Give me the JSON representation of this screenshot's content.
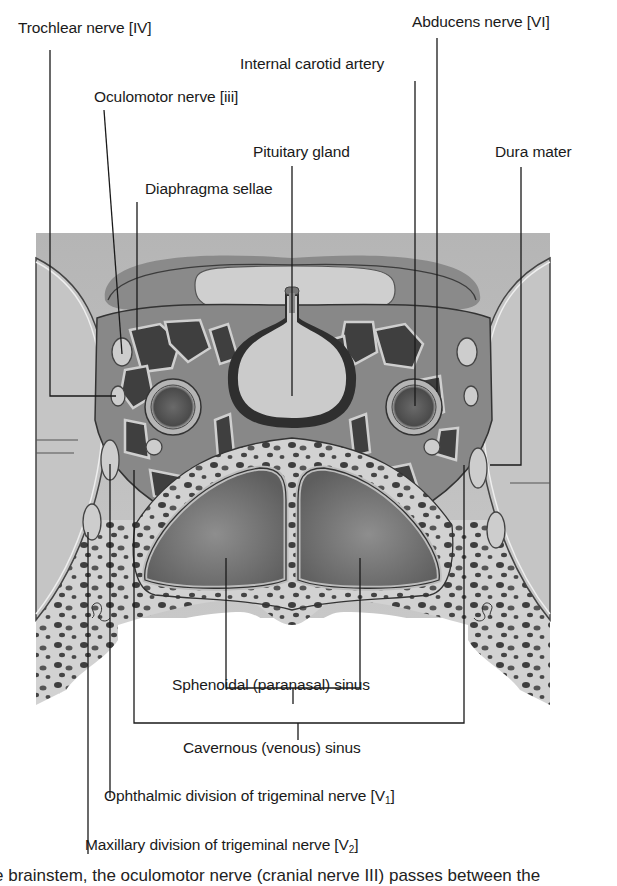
{
  "figure": {
    "labels": {
      "trochlear": "Trochlear nerve [IV]",
      "abducens": "Abducens nerve [VI]",
      "internal_carotid": "Internal carotid artery",
      "oculomotor": "Oculomotor nerve [iii]",
      "pituitary": "Pituitary gland",
      "dura": "Dura mater",
      "diaphragma": "Diaphragma sellae",
      "sphenoidal": "Sphenoidal (paranasal) sinus",
      "cavernous": "Cavernous (venous) sinus",
      "ophthalmic_prefix": "Ophthalmic division of trigeminal nerve [V",
      "ophthalmic_sub": "1",
      "ophthalmic_suffix": "]",
      "maxillary_prefix": "Maxillary division of trigeminal nerve [V",
      "maxillary_sub": "2",
      "maxillary_suffix": "]"
    },
    "colors": {
      "background": "#ffffff",
      "line": "#1a1a1a",
      "tissue_light": "#c9c9c9",
      "tissue_mid": "#a8a8a8",
      "tissue_dark": "#4a4a4a",
      "sinus_fill": "#7a7a7a"
    }
  },
  "caption": {
    "partial_text": "e brainstem, the oculomotor nerve (cranial nerve III) passes between the"
  }
}
